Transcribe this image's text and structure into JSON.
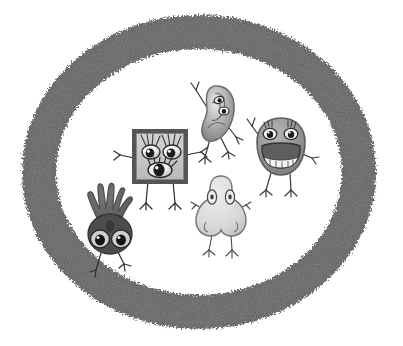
{
  "illustration": {
    "title": "Five senses cartoon characters inside a rough charcoal oval ring",
    "background_color": "#ffffff",
    "width": 403,
    "height": 346
  },
  "ring": {
    "name": "oval-ring",
    "color": "#585858",
    "edge_color": "#6e6e6e",
    "texture": "rough charcoal grain",
    "center_x": 199,
    "center_y": 172,
    "outer_rx": 177,
    "outer_ry": 157,
    "stroke_width": 34
  },
  "characters": [
    {
      "id": "eye-square",
      "label": "Eyes",
      "sense": "sight",
      "shape": "square-frame",
      "x": 160,
      "y": 155,
      "body_fill": "#c8c8c8",
      "frame_color": "#3a3a3a",
      "eye_count": 3,
      "limbs": {
        "arms": 2,
        "legs": 2
      }
    },
    {
      "id": "ear",
      "label": "Ear",
      "sense": "hearing",
      "shape": "ear",
      "x": 215,
      "y": 112,
      "body_fill": "#9a9a9a",
      "frame_color": "#5a5a5a",
      "eye_count": 2,
      "limbs": {
        "arms": 2,
        "legs": 2
      }
    },
    {
      "id": "mouth",
      "label": "Mouth",
      "sense": "taste",
      "shape": "lips",
      "x": 281,
      "y": 145,
      "body_fill": "#8c8c8c",
      "frame_color": "#4a4a4a",
      "eye_count": 2,
      "teeth": true,
      "limbs": {
        "arms": 2,
        "legs": 2
      }
    },
    {
      "id": "nose",
      "label": "Nose",
      "sense": "smell",
      "shape": "nose",
      "x": 221,
      "y": 212,
      "body_fill": "#e2e2e2",
      "frame_color": "#6a6a6a",
      "eye_count": 2,
      "limbs": {
        "arms": 2,
        "legs": 2
      }
    },
    {
      "id": "hand",
      "label": "Hand",
      "sense": "touch",
      "shape": "hand",
      "x": 108,
      "y": 224,
      "body_fill": "#555555",
      "frame_color": "#343434",
      "eye_count": 2,
      "limbs": {
        "arms": 0,
        "legs": 2
      }
    }
  ]
}
